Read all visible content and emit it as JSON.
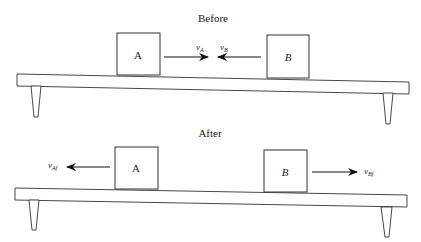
{
  "panels": {
    "before": {
      "title": "Before",
      "block_a": {
        "label": "A"
      },
      "block_b": {
        "label": "B"
      },
      "velocity_a": {
        "symbol": "v",
        "subscript": "A",
        "direction": "right"
      },
      "velocity_b": {
        "symbol": "v",
        "subscript": "B",
        "direction": "left"
      }
    },
    "after": {
      "title": "After",
      "block_a": {
        "label": "A"
      },
      "block_b": {
        "label": "B"
      },
      "velocity_a": {
        "symbol": "v",
        "subscript": "Af",
        "direction": "left"
      },
      "velocity_b": {
        "symbol": "v",
        "subscript": "Bf",
        "direction": "right"
      }
    }
  },
  "colors": {
    "stroke": "#333333",
    "background": "#ffffff"
  }
}
